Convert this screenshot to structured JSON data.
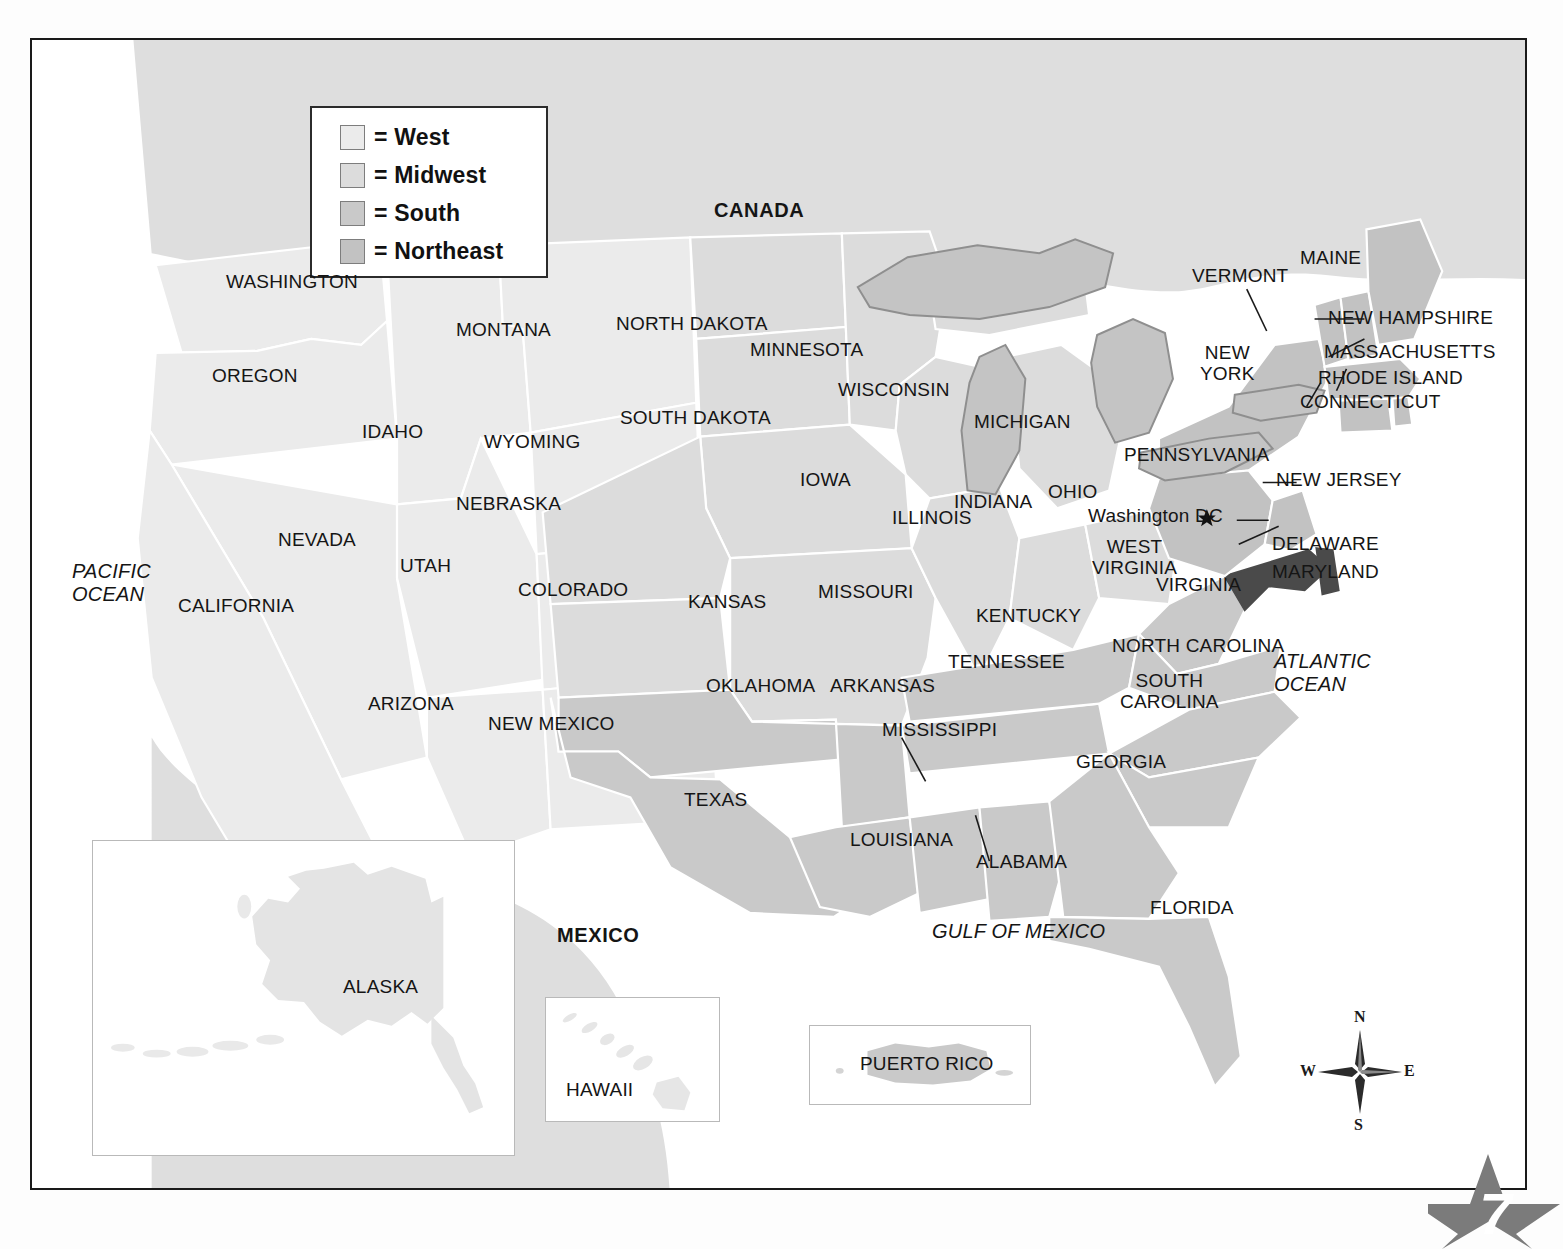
{
  "page": {
    "number": "7",
    "title_partial": ""
  },
  "legend": {
    "items": [
      {
        "label": "= West",
        "color": "#ebebeb"
      },
      {
        "label": "= Midwest",
        "color": "#dcdcdc"
      },
      {
        "label": "= South",
        "color": "#c9c9c9"
      },
      {
        "label": "= Northeast",
        "color": "#c2c2c2"
      }
    ]
  },
  "colors": {
    "west": "#ebebeb",
    "midwest": "#dcdcdc",
    "south": "#c9c9c9",
    "northeast": "#c2c2c2",
    "highlight": "#4a4a4a",
    "lakes": "#c4c4c4",
    "neighbor": "#dedede",
    "border": "#ffffff",
    "frame": "#1a1a1a",
    "text": "#151515"
  },
  "neighbors": [
    {
      "name": "CANADA",
      "label": "CANADA"
    },
    {
      "name": "MEXICO",
      "label": "MEXICO"
    }
  ],
  "oceans": [
    {
      "name": "pacific-ocean",
      "line1": "PACIFIC",
      "line2": "OCEAN"
    },
    {
      "name": "atlantic-ocean",
      "line1": "ATLANTIC",
      "line2": "OCEAN"
    },
    {
      "name": "gulf-of-mexico",
      "line1": "GULF OF MEXICO",
      "line2": ""
    }
  ],
  "capital": {
    "label": "Washington DC",
    "marker": "star-marker"
  },
  "compass": {
    "north": "N",
    "south": "S",
    "east": "E",
    "west": "W"
  },
  "insets": [
    {
      "name": "alaska",
      "label": "ALASKA",
      "region": "west"
    },
    {
      "name": "hawaii",
      "label": "HAWAII",
      "region": "west"
    },
    {
      "name": "puerto-rico",
      "label": "PUERTO RICO",
      "region": "south"
    }
  ],
  "states": [
    {
      "label": "WASHINGTON",
      "region": "west",
      "leader": false
    },
    {
      "label": "OREGON",
      "region": "west",
      "leader": false
    },
    {
      "label": "IDAHO",
      "region": "west",
      "leader": false
    },
    {
      "label": "MONTANA",
      "region": "west",
      "leader": false
    },
    {
      "label": "WYOMING",
      "region": "west",
      "leader": false
    },
    {
      "label": "NEVADA",
      "region": "west",
      "leader": false
    },
    {
      "label": "UTAH",
      "region": "west",
      "leader": false
    },
    {
      "label": "COLORADO",
      "region": "west",
      "leader": false
    },
    {
      "label": "CALIFORNIA",
      "region": "west",
      "leader": false
    },
    {
      "label": "ARIZONA",
      "region": "west",
      "leader": false
    },
    {
      "label": "NEW MEXICO",
      "region": "west",
      "leader": false
    },
    {
      "label": "NORTH DAKOTA",
      "region": "midwest",
      "leader": false
    },
    {
      "label": "SOUTH DAKOTA",
      "region": "midwest",
      "leader": false
    },
    {
      "label": "MINNESOTA",
      "region": "midwest",
      "leader": false
    },
    {
      "label": "WISCONSIN",
      "region": "midwest",
      "leader": false
    },
    {
      "label": "MICHIGAN",
      "region": "midwest",
      "leader": false
    },
    {
      "label": "IOWA",
      "region": "midwest",
      "leader": false
    },
    {
      "label": "NEBRASKA",
      "region": "midwest",
      "leader": false
    },
    {
      "label": "KANSAS",
      "region": "midwest",
      "leader": false
    },
    {
      "label": "MISSOURI",
      "region": "midwest",
      "leader": false
    },
    {
      "label": "ILLINOIS",
      "region": "midwest",
      "leader": false
    },
    {
      "label": "INDIANA",
      "region": "midwest",
      "leader": false
    },
    {
      "label": "OHIO",
      "region": "midwest",
      "leader": false
    },
    {
      "label": "OKLAHOMA",
      "region": "south",
      "leader": false
    },
    {
      "label": "TEXAS",
      "region": "south",
      "leader": false
    },
    {
      "label": "ARKANSAS",
      "region": "south",
      "leader": false
    },
    {
      "label": "LOUISIANA",
      "region": "south",
      "leader": false
    },
    {
      "label": "MISSISSIPPI",
      "region": "south",
      "leader": true
    },
    {
      "label": "ALABAMA",
      "region": "south",
      "leader": true
    },
    {
      "label": "TENNESSEE",
      "region": "south",
      "leader": false
    },
    {
      "label": "KENTUCKY",
      "region": "south",
      "leader": false
    },
    {
      "label": "WEST VIRGINIA",
      "region": "south",
      "leader": false
    },
    {
      "label": "VIRGINIA",
      "region": "south",
      "leader": false
    },
    {
      "label": "NORTH CAROLINA",
      "region": "south",
      "leader": false
    },
    {
      "label": "SOUTH CAROLINA",
      "region": "south",
      "leader": false
    },
    {
      "label": "GEORGIA",
      "region": "south",
      "leader": false
    },
    {
      "label": "FLORIDA",
      "region": "south",
      "leader": false
    },
    {
      "label": "MARYLAND",
      "region": "south",
      "leader": true
    },
    {
      "label": "DELAWARE",
      "region": "south",
      "leader": true
    },
    {
      "label": "MAINE",
      "region": "northeast",
      "leader": false
    },
    {
      "label": "VERMONT",
      "region": "northeast",
      "leader": true
    },
    {
      "label": "NEW HAMPSHIRE",
      "region": "northeast",
      "leader": true
    },
    {
      "label": "MASSACHUSETTS",
      "region": "northeast",
      "leader": true
    },
    {
      "label": "RHODE ISLAND",
      "region": "northeast",
      "leader": true
    },
    {
      "label": "CONNECTICUT",
      "region": "northeast",
      "leader": true
    },
    {
      "label": "NEW YORK",
      "region": "northeast",
      "leader": false
    },
    {
      "label": "PENNSYLVANIA",
      "region": "northeast",
      "leader": false
    },
    {
      "label": "NEW JERSEY",
      "region": "northeast",
      "leader": true
    }
  ],
  "labels": {
    "washington": "WASHINGTON",
    "oregon": "OREGON",
    "idaho": "IDAHO",
    "montana": "MONTANA",
    "wyoming": "WYOMING",
    "nevada": "NEVADA",
    "utah": "UTAH",
    "colorado": "COLORADO",
    "california": "CALIFORNIA",
    "arizona": "ARIZONA",
    "new_mexico": "NEW MEXICO",
    "north_dakota": "NORTH DAKOTA",
    "south_dakota": "SOUTH DAKOTA",
    "minnesota": "MINNESOTA",
    "wisconsin": "WISCONSIN",
    "michigan": "MICHIGAN",
    "iowa": "IOWA",
    "nebraska": "NEBRASKA",
    "kansas": "KANSAS",
    "missouri": "MISSOURI",
    "illinois": "ILLINOIS",
    "indiana": "INDIANA",
    "ohio": "OHIO",
    "oklahoma": "OKLAHOMA",
    "texas": "TEXAS",
    "arkansas": "ARKANSAS",
    "louisiana": "LOUISIANA",
    "mississippi": "MISSISSIPPI",
    "alabama": "ALABAMA",
    "tennessee": "TENNESSEE",
    "kentucky": "KENTUCKY",
    "west_virginia_1": "WEST",
    "west_virginia_2": "VIRGINIA",
    "virginia": "VIRGINIA",
    "north_carolina": "NORTH CAROLINA",
    "south_carolina_1": "SOUTH",
    "south_carolina_2": "CAROLINA",
    "georgia": "GEORGIA",
    "florida": "FLORIDA",
    "maryland": "MARYLAND",
    "delaware": "DELAWARE",
    "maine": "MAINE",
    "vermont": "VERMONT",
    "new_hampshire": "NEW HAMPSHIRE",
    "massachusetts": "MASSACHUSETTS",
    "rhode_island": "RHODE ISLAND",
    "connecticut": "CONNECTICUT",
    "new_york_1": "NEW",
    "new_york_2": "YORK",
    "pennsylvania": "PENNSYLVANIA",
    "new_jersey": "NEW JERSEY",
    "canada": "CANADA",
    "mexico": "MEXICO",
    "alaska": "ALASKA",
    "hawaii": "HAWAII",
    "puerto_rico": "PUERTO RICO",
    "washington_dc": "Washington DC",
    "pacific_1": "PACIFIC",
    "pacific_2": "OCEAN",
    "atlantic_1": "ATLANTIC",
    "atlantic_2": "OCEAN",
    "gulf": "GULF OF MEXICO"
  }
}
